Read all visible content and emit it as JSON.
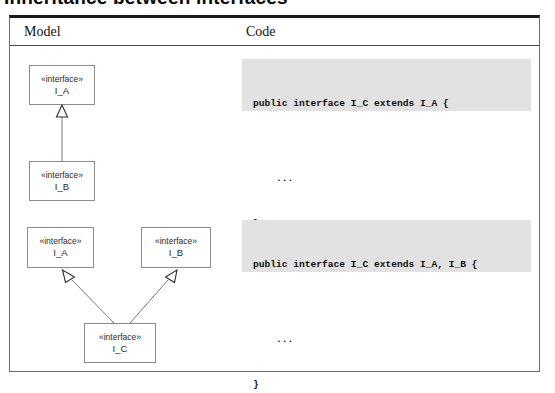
{
  "figure": {
    "heading": "Inheritance between interfaces",
    "columns": {
      "model_header": "Model",
      "code_header": "Code"
    }
  },
  "rows": [
    {
      "id": "single-inheritance",
      "diagram": {
        "type": "uml-class-diagram",
        "nodes": [
          {
            "id": "node-a-top",
            "stereotype": "«interface»",
            "name": "I_A",
            "x": 19,
            "y": 47,
            "width": 66,
            "height": 40
          },
          {
            "id": "node-b-top",
            "stereotype": "«interface»",
            "name": "I_B",
            "x": 19,
            "y": 143,
            "width": 66,
            "height": 40
          }
        ],
        "edges": [
          {
            "id": "edge-b-to-a",
            "from": "node-b-top",
            "to": "node-a-top",
            "kind": "generalization",
            "arrowhead": "hollow-triangle"
          }
        ]
      },
      "code": {
        "lines": [
          "public interface I_C extends I_A {",
          "",
          "    ...",
          "}"
        ]
      }
    },
    {
      "id": "multiple-inheritance",
      "diagram": {
        "type": "uml-class-diagram",
        "nodes": [
          {
            "id": "node-a-bot",
            "stereotype": "«interface»",
            "name": "I_A",
            "x": 17,
            "y": 209,
            "width": 67,
            "height": 41
          },
          {
            "id": "node-b-bot",
            "stereotype": "«interface»",
            "name": "I_B",
            "x": 131,
            "y": 209,
            "width": 70,
            "height": 41
          },
          {
            "id": "node-c-bot",
            "stereotype": "«interface»",
            "name": "I_C",
            "x": 74,
            "y": 305,
            "width": 72,
            "height": 40
          }
        ],
        "edges": [
          {
            "id": "edge-c-to-a",
            "from": "node-c-bot",
            "to": "node-a-bot",
            "kind": "generalization",
            "arrowhead": "hollow-triangle"
          },
          {
            "id": "edge-c-to-b",
            "from": "node-c-bot",
            "to": "node-b-bot",
            "kind": "generalization",
            "arrowhead": "hollow-triangle"
          }
        ]
      },
      "code": {
        "lines": [
          "public interface I_C extends I_A, I_B {",
          "",
          "    ...",
          "}"
        ]
      }
    }
  ],
  "code_blocks": {
    "first": {
      "line1": "public interface I_C extends I_A {",
      "line2": "",
      "line3": "    ...",
      "line4": "}"
    },
    "second": {
      "line1": "public interface I_C extends I_A, I_B {",
      "line2": "",
      "line3": "    ...",
      "line4": "}"
    }
  },
  "nodes": {
    "a_top": {
      "stereotype": "«interface»",
      "name": "I_A"
    },
    "b_top": {
      "stereotype": "«interface»",
      "name": "I_B"
    },
    "a_bot": {
      "stereotype": "«interface»",
      "name": "I_A"
    },
    "b_bot": {
      "stereotype": "«interface»",
      "name": "I_B"
    },
    "c_bot": {
      "stereotype": "«interface»",
      "name": "I_C"
    }
  },
  "colors": {
    "code_background": "#e2e2e2",
    "box_border": "#8c8c8c",
    "frame_border": "#6e6e6e",
    "frame_top_rule": "#1a1a1a",
    "edge_stroke": "#777777"
  }
}
